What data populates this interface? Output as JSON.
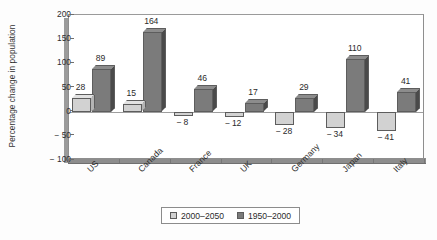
{
  "chart_data": {
    "type": "bar",
    "title": "",
    "xlabel": "",
    "ylabel": "Percentage change in population",
    "ylim": [
      -100,
      200
    ],
    "yticks": [
      200,
      150,
      100,
      50,
      0,
      -50,
      -100
    ],
    "ytick_labels": [
      "200",
      "150",
      "100",
      "50",
      "0",
      "− 50",
      "− 100"
    ],
    "grid": false,
    "legend_position": "bottom-center",
    "categories": [
      "US",
      "Canada",
      "France",
      "UK",
      "Germany",
      "Japan",
      "Italy"
    ],
    "series": [
      {
        "name": "2000–2050",
        "color": "#d2d2d2",
        "values": [
          28,
          15,
          -8,
          -12,
          -28,
          -34,
          -41
        ],
        "labels": [
          "28",
          "15",
          "− 8",
          "− 12",
          "− 28",
          "− 34",
          "− 41"
        ]
      },
      {
        "name": "1950–2000",
        "color": "#7b7b7b",
        "values": [
          89,
          164,
          46,
          17,
          29,
          110,
          41
        ],
        "labels": [
          "89",
          "164",
          "46",
          "17",
          "29",
          "110",
          "41"
        ]
      }
    ]
  },
  "legend": {
    "items": [
      {
        "label": "2000–2050",
        "swatch": "light"
      },
      {
        "label": "1950–2000",
        "swatch": "dark"
      }
    ]
  }
}
